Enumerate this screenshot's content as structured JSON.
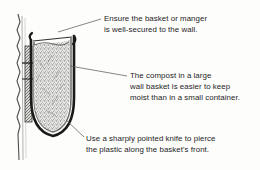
{
  "figure": {
    "name": "wall-basket-cross-section",
    "background_color": "#fdfdfc",
    "ink_color": "#1d1d1d"
  },
  "captions": [
    {
      "id": "secure-to-wall",
      "lines": [
        "Ensure the basket or manger",
        "is well-secured to the wall."
      ]
    },
    {
      "id": "compost-moisture",
      "lines": [
        "The compost in a large",
        "wall basket is easier to keep",
        "moist than in a small container."
      ]
    },
    {
      "id": "pierce-plastic",
      "lines": [
        "Use a sharply pointed knife to pierce",
        "the plastic along the basket's front."
      ]
    }
  ],
  "parts": [
    {
      "id": "wall",
      "label": "wall"
    },
    {
      "id": "bracket",
      "label": "wall bracket"
    },
    {
      "id": "basket-frame",
      "label": "basket frame"
    },
    {
      "id": "plastic-liner",
      "label": "plastic liner"
    },
    {
      "id": "compost",
      "label": "compost"
    }
  ]
}
